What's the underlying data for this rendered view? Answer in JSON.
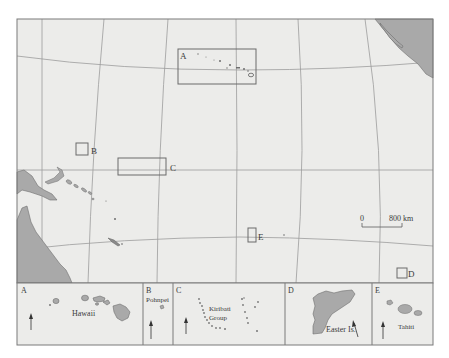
{
  "map": {
    "title": "Pacific Islands locator map",
    "colors": {
      "ocean": "#ececea",
      "land": "#a9a9a9",
      "land_outline": "#6e6e6e",
      "grid": "#9c9c9c",
      "frame": "#7a7a7a",
      "box": "#6a6a6a",
      "text": "#3a3a3a"
    },
    "locator_boxes": [
      {
        "id": "A",
        "label": "A"
      },
      {
        "id": "B",
        "label": "B"
      },
      {
        "id": "C",
        "label": "C"
      },
      {
        "id": "D",
        "label": "D"
      },
      {
        "id": "E",
        "label": "E"
      }
    ],
    "scale_bar": {
      "start_label": "0",
      "end_label": "800 km"
    }
  },
  "insets": [
    {
      "id": "A",
      "letter": "A",
      "name": "Hawaii"
    },
    {
      "id": "B",
      "letter": "B",
      "name": "Pohnpei"
    },
    {
      "id": "C",
      "letter": "C",
      "name_line1": "Kiribati",
      "name_line2": "Group"
    },
    {
      "id": "D",
      "letter": "D",
      "name": "Easter Is."
    },
    {
      "id": "E",
      "letter": "E",
      "name": "Tahiti"
    }
  ],
  "north_arrow": {
    "icon": "north-arrow-icon"
  }
}
